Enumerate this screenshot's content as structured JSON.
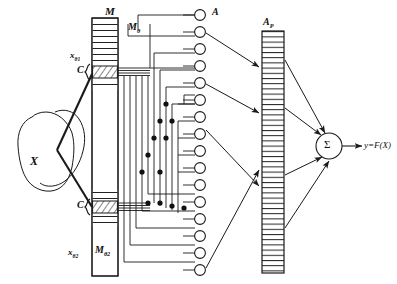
{
  "figure": {
    "type": "neural-network-schematic",
    "title_visible": false
  },
  "labels": {
    "stimulus_blob": "X",
    "memory_column_top": "M",
    "memory_column_bottom_sub": "M",
    "memory_column_bottom_subscript": "θ2",
    "memory_row_top_sub": "x",
    "memory_row_top_subscript": "θ1",
    "memory_row_bottom_sub": "x",
    "memory_row_bottom_subscript": "θ2",
    "coupler_top": "C",
    "coupler_bottom": "C",
    "wire_bundle": "M",
    "wire_bundle_subscript": "θ",
    "association_units": "A",
    "projection_bar": "A",
    "projection_bar_subscript": "P",
    "summing_unit": "Σ",
    "output": "y=F(X)"
  },
  "colors": {
    "stroke": "#1a1a1a",
    "fill": "#ffffff",
    "hatch": "#333333",
    "background": "#ffffff"
  },
  "counts": {
    "association_units": 16,
    "memory_top_stripes": 13,
    "memory_bottom_stripes": 7,
    "projection_bar_stripes": 46,
    "junction_dots": 12,
    "arrows_a_to_ap": 2,
    "arrows_ap_to_sigma": 4
  },
  "geometry": {
    "association_unit_cx": 200,
    "association_unit_r": 5.4,
    "association_unit_first_cy": 15,
    "association_unit_spacing": 17.0,
    "memory_column": {
      "x": 92,
      "y": 18,
      "w": 26,
      "h": 258
    },
    "projection_bar": {
      "x": 262,
      "y": 31,
      "w": 22,
      "h": 242
    },
    "sigma": {
      "cx": 329,
      "cy": 146,
      "r": 13
    }
  }
}
